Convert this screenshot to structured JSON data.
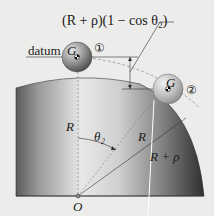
{
  "diagram": {
    "formula_label": "(R + ρ)(1 − cos θ₂)",
    "datum_label": "datum",
    "ball1": {
      "label": "G",
      "position_marker": "①"
    },
    "ball2": {
      "label": "G",
      "position_marker": "②"
    },
    "radius_vertical_label": "R",
    "radius_angled_label": "R",
    "radius_plus_rho_label": "R + ρ",
    "angle_label": "θ₂",
    "origin_label": "O",
    "colors": {
      "background": "#ececea",
      "cylinder_light": "#f4f4f4",
      "cylinder_dark": "#3a3a3a",
      "ball": "#8a8a8a",
      "line": "#333333",
      "dashed": "#777777"
    }
  }
}
